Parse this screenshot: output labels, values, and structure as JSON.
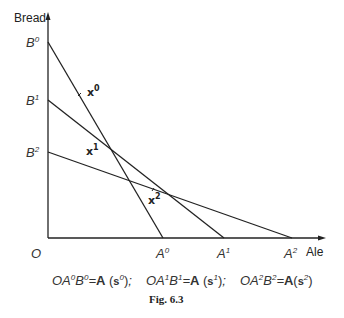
{
  "figure": {
    "caption": "Fig. 6.3",
    "y_axis_label": "Bread",
    "x_axis_label": "Ale",
    "origin_label": "O",
    "y_intercepts": [
      {
        "base": "B",
        "sup": "0"
      },
      {
        "base": "B",
        "sup": "1"
      },
      {
        "base": "B",
        "sup": "2"
      }
    ],
    "x_intercepts": [
      {
        "base": "A",
        "sup": "0"
      },
      {
        "base": "A",
        "sup": "1"
      },
      {
        "base": "A",
        "sup": "2"
      }
    ],
    "points": [
      {
        "base": "x",
        "sup": "0"
      },
      {
        "base": "x",
        "sup": "1"
      },
      {
        "base": "x",
        "sup": "2"
      }
    ],
    "equations": [
      {
        "lhs_a": "OA",
        "a_sup": "0",
        "lhs_b": "B",
        "b_sup": "0",
        "eq": "=",
        "fn": "A",
        "arg": "s",
        "arg_sup": "0",
        "tail": ";"
      },
      {
        "lhs_a": "OA",
        "a_sup": "1",
        "lhs_b": "B",
        "b_sup": "1",
        "eq": "=",
        "fn": "A",
        "arg": "s",
        "arg_sup": "1",
        "tail": ";"
      },
      {
        "lhs_a": "OA",
        "a_sup": "2",
        "lhs_b": "B",
        "b_sup": "2",
        "eq": "=",
        "fn": "A",
        "arg": "s",
        "arg_sup": "2",
        "tail": ""
      }
    ],
    "lines": [
      {
        "from": "B0",
        "to": "A0"
      },
      {
        "from": "B1",
        "to": "A1"
      },
      {
        "from": "B2",
        "to": "A2"
      }
    ]
  }
}
